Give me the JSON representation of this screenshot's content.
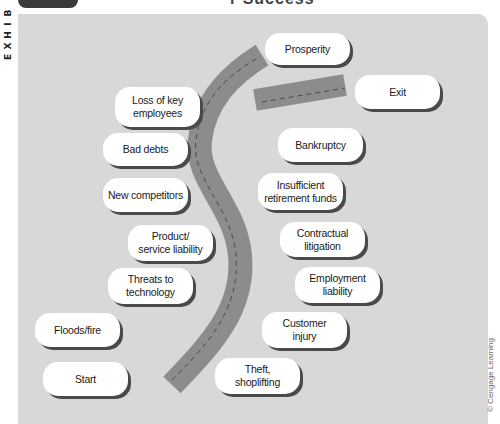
{
  "header": {
    "exhibit_letters": [
      "B",
      "I",
      "H",
      "X",
      "E"
    ],
    "title_fragment": "r Success"
  },
  "diagram": {
    "type": "road-map",
    "colors": {
      "panel": "#d8d8d8",
      "road": "#8c8c8c",
      "road_dash": "#4a4a4a",
      "box_fill": "#ffffff",
      "box_shadow": "#4a4a4a",
      "tab": "#3a3a3a"
    },
    "left_boxes": [
      {
        "id": "loss-of-key-employees",
        "label": "Loss of key\nemployees"
      },
      {
        "id": "bad-debts",
        "label": "Bad debts"
      },
      {
        "id": "new-competitors",
        "label": "New competitors"
      },
      {
        "id": "product-service-liability",
        "label": "Product/\nservice liability"
      },
      {
        "id": "threats-to-technology",
        "label": "Threats to\ntechnology"
      },
      {
        "id": "floods-fire",
        "label": "Floods/fire"
      },
      {
        "id": "start",
        "label": "Start"
      }
    ],
    "right_boxes": [
      {
        "id": "prosperity",
        "label": "Prosperity"
      },
      {
        "id": "exit",
        "label": "Exit"
      },
      {
        "id": "bankruptcy",
        "label": "Bankruptcy"
      },
      {
        "id": "insufficient-retirement-funds",
        "label": "Insufficient\nretirement funds"
      },
      {
        "id": "contractual-litigation",
        "label": "Contractual\nlitigation"
      },
      {
        "id": "employment-liability",
        "label": "Employment\nliability"
      },
      {
        "id": "customer-injury",
        "label": "Customer\ninjury"
      },
      {
        "id": "theft-shoplifting",
        "label": "Theft,\nshoplifting"
      }
    ]
  },
  "credit": "© Cengage Learning"
}
